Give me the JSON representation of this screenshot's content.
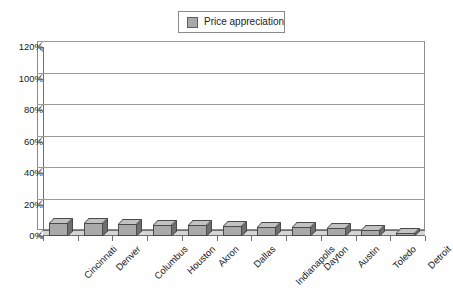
{
  "legend": {
    "entries": [
      {
        "label": "Price appreciation",
        "color": "#a9a9a9",
        "swatch": "series-swatch"
      }
    ]
  },
  "axes": {
    "y_ticks": [
      "0%",
      "20%",
      "40%",
      "60%",
      "80%",
      "100%",
      "120%"
    ],
    "x_labels": [
      "Cincinnati",
      "Denver",
      "Columbus",
      "Houston",
      "Akron",
      "Dallas",
      "Indianapolis",
      "Dayton",
      "Austin",
      "Toledo",
      "Detroit"
    ]
  },
  "chart_data": {
    "type": "bar",
    "title": "",
    "subtitle": "",
    "xlabel": "",
    "ylabel": "",
    "ylim": [
      0,
      120
    ],
    "ytick_values": [
      0,
      20,
      40,
      60,
      80,
      100,
      120
    ],
    "ytick_labels": [
      "0%",
      "20%",
      "40%",
      "60%",
      "80%",
      "100%",
      "120%"
    ],
    "grid": true,
    "grid_axis": "y",
    "legend_position": "top-center",
    "three_d": true,
    "categories": [
      "Cincinnati",
      "Denver",
      "Columbus",
      "Houston",
      "Akron",
      "Dallas",
      "Indianapolis",
      "Dayton",
      "Austin",
      "Toledo",
      "Detroit"
    ],
    "series": [
      {
        "name": "Price appreciation",
        "color": "#a9a9a9",
        "values": [
          8,
          8,
          7.5,
          7,
          7,
          6.5,
          6,
          5.5,
          5,
          4,
          2
        ]
      }
    ]
  }
}
